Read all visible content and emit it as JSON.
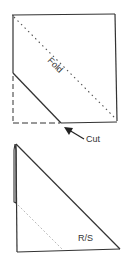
{
  "diagram": {
    "top_figure": {
      "fold_label": "Fold",
      "cut_label": "Cut"
    },
    "bottom_figure": {
      "side_label": "R/S"
    },
    "colors": {
      "line": "#333333",
      "dotted": "#555555",
      "faint": "#bbbbbb",
      "background": "#ffffff"
    }
  }
}
